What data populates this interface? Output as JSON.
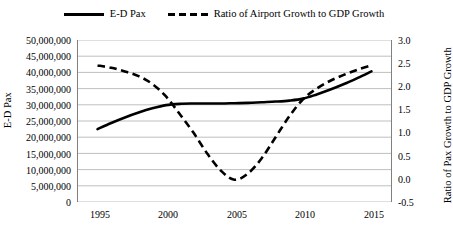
{
  "legend": {
    "position": "top-center",
    "entries": [
      {
        "label": "E-D Pax",
        "style": "solid",
        "icon": "solid-line-icon"
      },
      {
        "label": "Ratio of Airport Growth to GDP Growth",
        "style": "dashed",
        "icon": "dashed-line-icon"
      }
    ]
  },
  "axes": {
    "y_left": {
      "title": "E-D Pax",
      "ticks": [
        "0",
        "5,000,000",
        "10,000,000",
        "15,000,000",
        "20,000,000",
        "25,000,000",
        "30,000,000",
        "35,000,000",
        "40,000,000",
        "45,000,000",
        "50,000,000"
      ]
    },
    "y_right": {
      "title": "Ratio of Pax Growth to GDP Growth",
      "ticks": [
        "-0.5",
        "0.0",
        "0.5",
        "1.0",
        "1.5",
        "2.0",
        "2.5",
        "3.0"
      ]
    },
    "x": {
      "ticks": [
        "1995",
        "2000",
        "2005",
        "2010",
        "2015"
      ]
    }
  },
  "chart_data": {
    "type": "line",
    "title": "",
    "xlabel": "",
    "ylabel": "E-D Pax",
    "y2label": "Ratio of Pax Growth to GDP Growth",
    "grid": true,
    "legend_position": "top-center",
    "xlim": [
      1993.5,
      2016.5
    ],
    "ylim": [
      0,
      50000000
    ],
    "y2lim": [
      -0.5,
      3.0
    ],
    "xticks": [
      1995,
      2000,
      2005,
      2010,
      2015
    ],
    "yticks": [
      0,
      5000000,
      10000000,
      15000000,
      20000000,
      25000000,
      30000000,
      35000000,
      40000000,
      45000000,
      50000000
    ],
    "y2ticks": [
      -0.5,
      0.0,
      0.5,
      1.0,
      1.5,
      2.0,
      2.5,
      3.0
    ],
    "x": [
      1995,
      1996,
      1997,
      1998,
      1999,
      2000,
      2001,
      2002,
      2003,
      2004,
      2005,
      2006,
      2007,
      2008,
      2009,
      2010,
      2011,
      2012,
      2013,
      2014,
      2015
    ],
    "series": [
      {
        "name": "E-D Pax",
        "axis": "left",
        "style": "solid",
        "color": "#000000",
        "values": [
          22500000,
          24400000,
          26100000,
          27600000,
          28900000,
          29900000,
          30300000,
          30400000,
          30400000,
          30400000,
          30500000,
          30600000,
          30800000,
          31000000,
          31300000,
          31900000,
          33200000,
          34700000,
          36400000,
          38300000,
          40300000
        ]
      },
      {
        "name": "Ratio of Airport Growth to GDP Growth",
        "axis": "right",
        "style": "dashed",
        "color": "#000000",
        "values": [
          2.45,
          2.4,
          2.32,
          2.22,
          2.05,
          1.78,
          1.4,
          1.0,
          0.55,
          0.18,
          -0.02,
          0.12,
          0.45,
          0.9,
          1.35,
          1.72,
          1.95,
          2.12,
          2.25,
          2.36,
          2.45
        ]
      }
    ]
  }
}
